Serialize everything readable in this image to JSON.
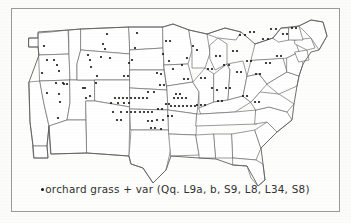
{
  "figure": {
    "type": "dot-distribution-map",
    "region": "conterminous United States",
    "frame": {
      "border_color": "#9a9a9a",
      "background": "#fdfdfc"
    },
    "map": {
      "outline_color": "#6f6f6f",
      "dot_color": "#15150f",
      "dot_size_px": 2.2,
      "subdivisions": "state boundaries"
    },
    "caption": {
      "legend_symbol": "dot-symbol",
      "text": "orchard grass + var (Qq. L9a, b, S9, L8, L34, S8)",
      "species": "orchard grass",
      "qualifier": "+ var",
      "sample_codes": [
        "Qq.",
        "L9a",
        "b",
        "S9",
        "L8",
        "L34",
        "S8"
      ]
    }
  },
  "chart_data": {
    "type": "scatter",
    "title": "",
    "subtitle": "",
    "xlabel": "",
    "ylabel": "",
    "legend": [
      "orchard grass + var (Qq. L9a, b, S9, L8, L34, S8)"
    ],
    "legend_position": "bottom",
    "grid": false,
    "xlim": [
      0,
      329
    ],
    "ylim": [
      0,
      204
    ],
    "note": "Map coordinates are figure-pixel positions of collection-site dots over a US state outline map.",
    "series": [
      {
        "name": "orchard grass + var",
        "marker": "filled-circle",
        "color": "#15150f",
        "count": 152,
        "points": [
          [
            33,
            38
          ],
          [
            36,
            52
          ],
          [
            43,
            52
          ],
          [
            46,
            57
          ],
          [
            31,
            65
          ],
          [
            45,
            75
          ],
          [
            36,
            85
          ],
          [
            48,
            63
          ],
          [
            48,
            86
          ],
          [
            49,
            94
          ],
          [
            47,
            110
          ],
          [
            52,
            75
          ],
          [
            53,
            76
          ],
          [
            56,
            76
          ],
          [
            72,
            80
          ],
          [
            74,
            80
          ],
          [
            75,
            90
          ],
          [
            79,
            88
          ],
          [
            85,
            75
          ],
          [
            77,
            47
          ],
          [
            79,
            52
          ],
          [
            80,
            59
          ],
          [
            86,
            68
          ],
          [
            96,
            26
          ],
          [
            92,
            36
          ],
          [
            94,
            41
          ],
          [
            90,
            49
          ],
          [
            99,
            50
          ],
          [
            104,
            90
          ],
          [
            108,
            90
          ],
          [
            112,
            90
          ],
          [
            116,
            90
          ],
          [
            120,
            90
          ],
          [
            100,
            95
          ],
          [
            107,
            95
          ],
          [
            113,
            95
          ],
          [
            118,
            95
          ],
          [
            124,
            90
          ],
          [
            128,
            90
          ],
          [
            132,
            90
          ],
          [
            136,
            90
          ],
          [
            102,
            104
          ],
          [
            110,
            104
          ],
          [
            116,
            104
          ],
          [
            120,
            104
          ],
          [
            124,
            104
          ],
          [
            129,
            104
          ],
          [
            133,
            104
          ],
          [
            137,
            104
          ],
          [
            141,
            104
          ],
          [
            106,
            112
          ],
          [
            110,
            112
          ],
          [
            118,
            55
          ],
          [
            121,
            52
          ],
          [
            126,
            25
          ],
          [
            124,
            40
          ],
          [
            113,
            68
          ],
          [
            117,
            68
          ],
          [
            137,
            113
          ],
          [
            141,
            113
          ],
          [
            146,
            112
          ],
          [
            152,
            112
          ],
          [
            140,
            120
          ],
          [
            144,
            120
          ],
          [
            150,
            121
          ],
          [
            137,
            84
          ],
          [
            143,
            84
          ],
          [
            146,
            65
          ],
          [
            150,
            66
          ],
          [
            155,
            33
          ],
          [
            159,
            33
          ],
          [
            152,
            46
          ],
          [
            158,
            53
          ],
          [
            162,
            61
          ],
          [
            149,
            77
          ],
          [
            153,
            77
          ],
          [
            155,
            96
          ],
          [
            158,
            96
          ],
          [
            147,
            101
          ],
          [
            151,
            101
          ],
          [
            163,
            90
          ],
          [
            167,
            90
          ],
          [
            171,
            90
          ],
          [
            175,
            90
          ],
          [
            160,
            98
          ],
          [
            164,
            98
          ],
          [
            168,
            98
          ],
          [
            172,
            98
          ],
          [
            176,
            98
          ],
          [
            180,
            98
          ],
          [
            184,
            98
          ],
          [
            157,
            108
          ],
          [
            161,
            108
          ],
          [
            165,
            86
          ],
          [
            169,
            86
          ],
          [
            171,
            57
          ],
          [
            176,
            50
          ],
          [
            182,
            38
          ],
          [
            186,
            42
          ],
          [
            173,
            71
          ],
          [
            177,
            71
          ],
          [
            190,
            70
          ],
          [
            194,
            70
          ],
          [
            186,
            97
          ],
          [
            190,
            97
          ],
          [
            194,
            97
          ],
          [
            197,
            61
          ],
          [
            201,
            61
          ],
          [
            205,
            48
          ],
          [
            209,
            48
          ],
          [
            201,
            80
          ],
          [
            206,
            82
          ],
          [
            213,
            57
          ],
          [
            218,
            57
          ],
          [
            222,
            43
          ],
          [
            226,
            43
          ],
          [
            229,
            27
          ],
          [
            234,
            27
          ],
          [
            239,
            24
          ],
          [
            243,
            24
          ],
          [
            252,
            31
          ],
          [
            257,
            31
          ],
          [
            260,
            21
          ],
          [
            265,
            21
          ],
          [
            272,
            26
          ],
          [
            276,
            26
          ],
          [
            281,
            20
          ],
          [
            285,
            20
          ],
          [
            226,
            64
          ],
          [
            230,
            64
          ],
          [
            236,
            53
          ],
          [
            240,
            53
          ],
          [
            245,
            66
          ],
          [
            249,
            66
          ],
          [
            255,
            55
          ],
          [
            259,
            55
          ],
          [
            266,
            48
          ],
          [
            270,
            48
          ],
          [
            215,
            80
          ],
          [
            219,
            80
          ],
          [
            232,
            88
          ],
          [
            236,
            88
          ],
          [
            244,
            94
          ],
          [
            248,
            94
          ],
          [
            207,
            93
          ],
          [
            211,
            93
          ]
        ]
      }
    ]
  }
}
